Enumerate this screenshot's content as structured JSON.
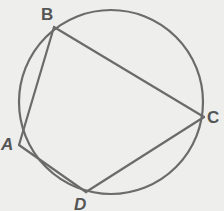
{
  "diagram": {
    "type": "inscribed-quadrilateral",
    "colors": {
      "background": "#eeeeed",
      "stroke": "#6b6b6b",
      "label": "#555555"
    },
    "circle": {
      "cx": 111,
      "cy": 102,
      "r": 92
    },
    "points": [
      {
        "name": "A",
        "x": 19,
        "y": 145,
        "label": "A",
        "label_x": 1,
        "label_y": 150
      },
      {
        "name": "B",
        "x": 54,
        "y": 27,
        "label": "B",
        "label_x": 41,
        "label_y": 20
      },
      {
        "name": "C",
        "x": 204,
        "y": 117,
        "label": "C",
        "label_x": 207,
        "label_y": 123
      },
      {
        "name": "D",
        "x": 86,
        "y": 192,
        "label": "D",
        "label_x": 74,
        "label_y": 210
      }
    ],
    "segments": [
      {
        "name": "AB",
        "from": "A",
        "to": "B"
      },
      {
        "name": "BC",
        "from": "B",
        "to": "C"
      },
      {
        "name": "CD",
        "from": "C",
        "to": "D"
      },
      {
        "name": "DA",
        "from": "D",
        "to": "A"
      }
    ]
  }
}
